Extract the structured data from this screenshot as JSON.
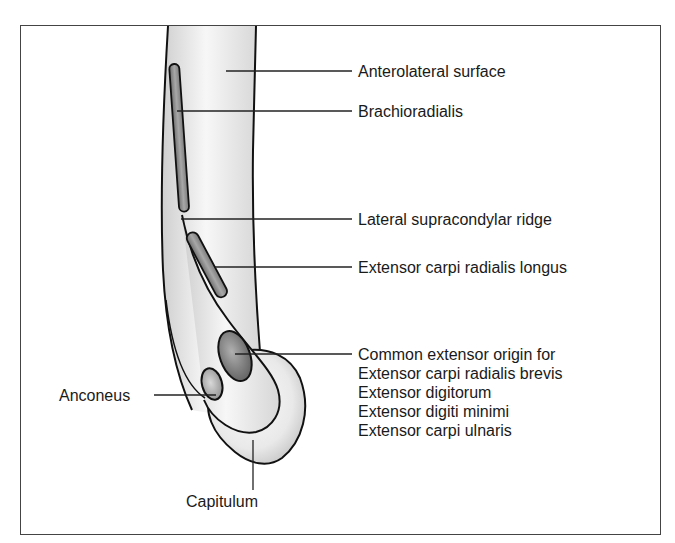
{
  "figure": {
    "type": "anatomical-diagram",
    "labels": {
      "anterolateral_surface": "Anterolateral surface",
      "brachioradialis": "Brachioradialis",
      "lateral_supracondylar_ridge": "Lateral supracondylar ridge",
      "ecrl": "Extensor carpi radialis longus",
      "common_extensor": {
        "line1": "Common extensor origin for",
        "line2": "Extensor carpi radialis brevis",
        "line3": "Extensor digitorum",
        "line4": "Extensor digiti minimi",
        "line5": "Extensor carpi ulnaris"
      },
      "anconeus": "Anconeus",
      "capitulum": "Capitulum"
    },
    "colors": {
      "outline": "#111111",
      "bone_light": "#f4f4f4",
      "bone_shade": "#cfcfcf",
      "muscle_area": "#8a8a8a",
      "muscle_dark": "#6a6a6a",
      "leader": "#222222",
      "frame": "#444444"
    }
  }
}
